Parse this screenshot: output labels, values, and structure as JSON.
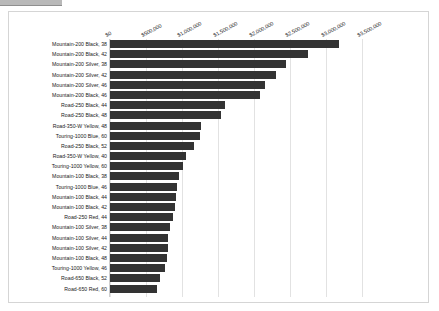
{
  "window": {
    "top_stub": ""
  },
  "chart_data": {
    "type": "bar",
    "orientation": "horizontal",
    "title": "",
    "xlabel": "",
    "ylabel": "",
    "xlim": [
      0,
      3500000
    ],
    "grid": true,
    "legend": "none",
    "bar_color": "#333333",
    "grid_color": "#e2e2e2",
    "background": "#ffffff",
    "xtick_labels": [
      "$0",
      "$500,000",
      "$1,000,000",
      "$1,500,000",
      "$2,000,000",
      "$2,500,000",
      "$3,000,000",
      "$3,500,000"
    ],
    "xtick_values": [
      0,
      500000,
      1000000,
      1500000,
      2000000,
      2500000,
      3000000,
      3500000
    ],
    "categories": [
      "Mountain-200 Black, 38",
      "Mountain-200 Black, 42",
      "Mountain-200 Silver, 38",
      "Mountain-200 Silver, 42",
      "Mountain-200 Silver, 46",
      "Mountain-200 Black, 46",
      "Road-250 Black, 44",
      "Road-250 Black, 48",
      "Road-350-W Yellow, 48",
      "Touring-1000 Blue, 60",
      "Road-250 Black, 52",
      "Road-350-W Yellow, 40",
      "Touring-1000 Yellow, 60",
      "Mountain-100 Black, 38",
      "Touring-1000 Blue, 46",
      "Mountain-100 Black, 44",
      "Mountain-100 Black, 42",
      "Road-250 Red, 44",
      "Mountain-100 Silver, 38",
      "Mountain-100 Silver, 44",
      "Mountain-100 Silver, 42",
      "Mountain-100 Black, 48",
      "Touring-1000 Yellow, 46",
      "Road-650 Black, 52",
      "Road-650 Red, 60"
    ],
    "values": [
      3180000,
      2750000,
      2440000,
      2310000,
      2150000,
      2080000,
      1600000,
      1540000,
      1260000,
      1250000,
      1170000,
      1050000,
      1020000,
      960000,
      930000,
      910000,
      900000,
      880000,
      830000,
      810000,
      800000,
      790000,
      760000,
      690000,
      650000
    ]
  }
}
